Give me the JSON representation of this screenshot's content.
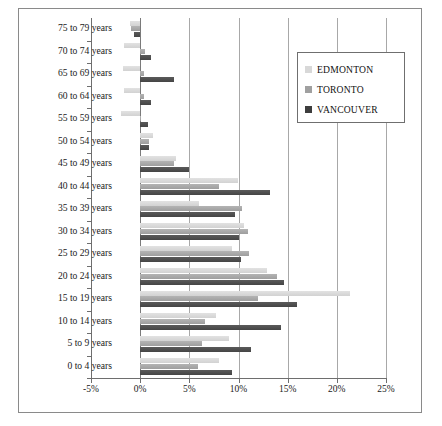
{
  "chart_data": {
    "type": "bar",
    "orientation": "horizontal",
    "title": "",
    "xlabel": "",
    "ylabel": "",
    "xlim": [
      -5,
      25
    ],
    "xticks": [
      -5,
      0,
      5,
      10,
      15,
      20,
      25
    ],
    "xtick_labels": [
      "-5%",
      "0%",
      "5%",
      "10%",
      "15%",
      "20%",
      "25%"
    ],
    "grid": true,
    "legend_position": "upper right",
    "categories": [
      "75 to 79 years",
      "70 to 74 years",
      "65 to 69 years",
      "60 to 64 years",
      "55 to 59 years",
      "50 to 54 years",
      "45 to 49 years",
      "40 to 44 years",
      "35 to 39 years",
      "30 to 34 years",
      "25 to 29 years",
      "20 to 24 years",
      "15 to 19 years",
      "10 to 14 years",
      "5 to 9 years",
      "0 to 4 years"
    ],
    "series": [
      {
        "name": "EDMONTON",
        "color": "#d8d8d8",
        "values": [
          -1.0,
          -1.6,
          -1.7,
          -1.6,
          -2.0,
          1.3,
          3.6,
          9.9,
          6.0,
          10.6,
          9.3,
          12.9,
          21.3,
          7.7,
          9.0,
          8.0
        ]
      },
      {
        "name": "TORONTO",
        "color": "#a0a0a0",
        "values": [
          -0.9,
          0.5,
          0.4,
          0.4,
          0.0,
          0.9,
          3.4,
          8.0,
          10.4,
          11.0,
          11.1,
          13.9,
          12.0,
          6.6,
          6.3,
          5.9
        ]
      },
      {
        "name": "VANCOUVER",
        "color": "#3d3d3d",
        "values": [
          -0.6,
          1.1,
          3.4,
          1.1,
          0.8,
          0.9,
          5.0,
          13.2,
          9.6,
          10.1,
          10.3,
          14.6,
          16.0,
          14.3,
          11.3,
          9.3
        ]
      }
    ]
  },
  "legend": {
    "items": [
      {
        "label": "EDMONTON"
      },
      {
        "label": "TORONTO"
      },
      {
        "label": "VANCOUVER"
      }
    ]
  }
}
